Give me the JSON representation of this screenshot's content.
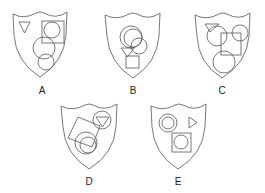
{
  "figure": {
    "shields": [
      {
        "label": "A",
        "shapes": [
          "triangle",
          "square",
          "circle",
          "circle",
          "circle"
        ]
      },
      {
        "label": "B",
        "shapes": [
          "circle",
          "circle",
          "circle",
          "triangle",
          "square"
        ]
      },
      {
        "label": "C",
        "shapes": [
          "triangle",
          "circle",
          "circle",
          "square",
          "circle"
        ]
      },
      {
        "label": "D",
        "shapes": [
          "square",
          "circle",
          "circle",
          "circle",
          "triangle"
        ]
      },
      {
        "label": "E",
        "shapes": [
          "circle",
          "circle",
          "triangle",
          "square",
          "circle"
        ]
      }
    ],
    "colors": {
      "stroke": "#555555",
      "background": "#ffffff",
      "text": "#222222"
    }
  }
}
